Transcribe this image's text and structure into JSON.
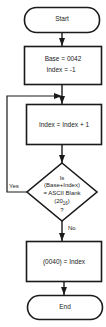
{
  "flowchart": {
    "start": {
      "label": "Start"
    },
    "init": {
      "line1": "Base = 0042",
      "line2": "Index = -1"
    },
    "increment": {
      "label": "Index = Index + 1"
    },
    "decision": {
      "line1": "Is",
      "line2": "(Base+Index)",
      "line3": "= ASCII Blank",
      "line4_main": "(20",
      "line4_sub": "16",
      "line4_end": ")",
      "line5": "?",
      "yes_label": "Yes",
      "no_label": "No"
    },
    "store": {
      "label": "(0040) = Index"
    },
    "end": {
      "label": "End"
    }
  },
  "colors": {
    "stroke": "#1a1a1a",
    "background": "#ffffff"
  }
}
